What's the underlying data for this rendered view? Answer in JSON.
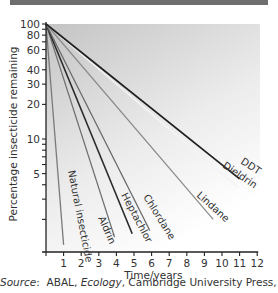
{
  "chart_data": {
    "type": "line",
    "title": "",
    "xlabel": "Time/years",
    "ylabel": "Percentage insecticide remaining",
    "xlim": [
      0,
      12
    ],
    "ylim": [
      1,
      100
    ],
    "yscale": "log",
    "x_ticks": [
      1,
      2,
      3,
      4,
      5,
      6,
      7,
      8,
      9,
      10,
      11,
      12
    ],
    "y_ticks": [
      100,
      80,
      60,
      40,
      30,
      20,
      10,
      5
    ],
    "grid": false,
    "legend": "inline labels at line ends",
    "series": [
      {
        "name": "Natural insecticide",
        "x": [
          0,
          1.0
        ],
        "y": [
          100,
          1.2
        ]
      },
      {
        "name": "Aldrin",
        "x": [
          0,
          3.9
        ],
        "y": [
          100,
          1.4
        ]
      },
      {
        "name": "Heptachlor",
        "x": [
          0,
          4.9
        ],
        "y": [
          100,
          1.5
        ]
      },
      {
        "name": "Chlordane",
        "x": [
          0,
          5.9
        ],
        "y": [
          100,
          1.6
        ]
      },
      {
        "name": "Lindane",
        "x": [
          0,
          9.5
        ],
        "y": [
          100,
          2.0
        ]
      },
      {
        "name": "Dieldrin",
        "x": [
          0,
          10.9
        ],
        "y": [
          100,
          3.8
        ]
      },
      {
        "name": "DDT",
        "x": [
          0,
          11.0
        ],
        "y": [
          100,
          4.5
        ]
      }
    ]
  },
  "source": {
    "prefix": "Source",
    "author": "ABAL, ",
    "work": "Ecology",
    "rest": ", Cambridge University Press, 1985"
  }
}
